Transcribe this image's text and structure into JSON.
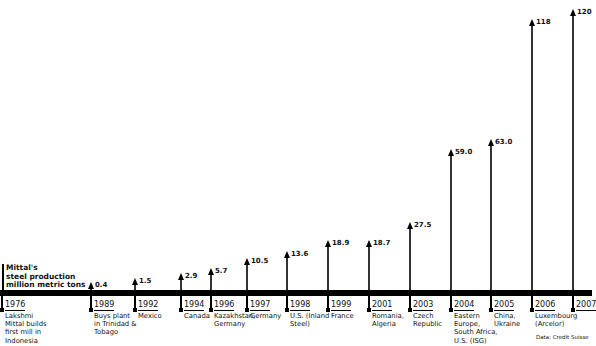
{
  "chart_data": {
    "type": "bar",
    "title": "Mittal's steel production million metric tons",
    "xlabel": "",
    "ylabel": "million metric tons",
    "categories": [
      "1976",
      "1989",
      "1992",
      "1994",
      "1996",
      "1997",
      "1998",
      "1999",
      "2001",
      "2003",
      "2004",
      "2005",
      "2006",
      "2007"
    ],
    "values": [
      null,
      0.4,
      1.5,
      2.9,
      5.7,
      10.5,
      13.6,
      18.9,
      18.7,
      27.5,
      59.0,
      63.0,
      118,
      120
    ],
    "value_labels": [
      "",
      "0.4",
      "1.5",
      "2.9",
      "5.7",
      "10.5",
      "13.6",
      "18.9",
      "18.7",
      "27.5",
      "59.0",
      "63.0",
      "118",
      "120"
    ],
    "annotations": [
      "Lakshmi Mittal builds first mill in Indonesia",
      "Buys plant in Trinidad & Tobago",
      "Mexico",
      "Canada",
      "Kazakhstan, Germany",
      "Germany",
      "U.S. (Inland Steel)",
      "France",
      "Romania, Algeria",
      "Czech Republic",
      "Eastern Europe, South Africa, U.S. (ISG)",
      "China, Ukraine",
      "Luxembourg (Arcelor)",
      ""
    ],
    "ylim": [
      0,
      120
    ],
    "grid": false,
    "legend_position": "left",
    "source": "Data: Credit Suisse"
  },
  "legend": {
    "line1": "Mittal's",
    "line2": "steel production",
    "line3": "million metric tons"
  },
  "source": "Data: Credit Suisse",
  "events": [
    {
      "year": "1976",
      "value": "",
      "x": 2,
      "tip": null,
      "desc": [
        "Lakshmi",
        "Mittal builds",
        "first mill in",
        "Indonesia"
      ]
    },
    {
      "year": "1989",
      "value": "0.4",
      "x": 91,
      "tip": 282,
      "desc": [
        "Buys plant",
        "in Trinidad &",
        "Tobago"
      ]
    },
    {
      "year": "1992",
      "value": "1.5",
      "x": 135,
      "tip": 278,
      "desc": [
        "Mexico"
      ]
    },
    {
      "year": "1994",
      "value": "2.9",
      "x": 181,
      "tip": 273,
      "desc": [
        "Canada"
      ]
    },
    {
      "year": "1996",
      "value": "5.7",
      "x": 211,
      "tip": 268,
      "desc": [
        "Kazakhstan,",
        "Germany"
      ]
    },
    {
      "year": "1997",
      "value": "10.5",
      "x": 247,
      "tip": 258,
      "desc": [
        "Germany"
      ]
    },
    {
      "year": "1998",
      "value": "13.6",
      "x": 287,
      "tip": 251,
      "desc": [
        "U.S. (Inland",
        "Steel)"
      ]
    },
    {
      "year": "1999",
      "value": "18.9",
      "x": 328,
      "tip": 240,
      "desc": [
        "France"
      ]
    },
    {
      "year": "2001",
      "value": "18.7",
      "x": 369,
      "tip": 240,
      "desc": [
        "Romania,",
        "Algeria"
      ]
    },
    {
      "year": "2003",
      "value": "27.5",
      "x": 410,
      "tip": 222,
      "desc": [
        "Czech",
        "Republic"
      ]
    },
    {
      "year": "2004",
      "value": "59.0",
      "x": 451,
      "tip": 149,
      "desc": [
        "Eastern",
        "Europe,",
        "South Africa,",
        "U.S. (ISG)"
      ]
    },
    {
      "year": "2005",
      "value": "63.0",
      "x": 491,
      "tip": 139,
      "desc": [
        "China,",
        "Ukraine"
      ]
    },
    {
      "year": "2006",
      "value": "118",
      "x": 532,
      "tip": 19,
      "desc": [
        "Luxembourg",
        "(Arcelor)"
      ]
    },
    {
      "year": "2007",
      "value": "120",
      "x": 573,
      "tip": 9,
      "desc": []
    }
  ]
}
